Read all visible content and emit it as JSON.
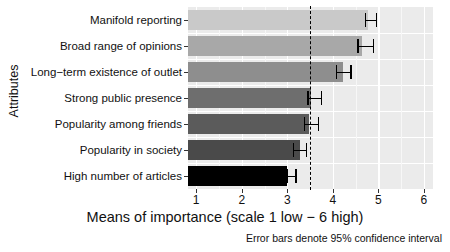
{
  "chart_data": {
    "type": "bar",
    "orientation": "horizontal",
    "title": "",
    "xlabel": "Means of importance (scale 1 low − 6 high)",
    "ylabel": "Attributes",
    "categories": [
      "Manifold reporting",
      "Broad range of opinions",
      "Long−term existence of outlet",
      "Strong public presence",
      "Popularity among friends",
      "Popularity in society",
      "High number of articles"
    ],
    "values": [
      4.78,
      4.64,
      4.23,
      3.51,
      3.47,
      3.29,
      3.0
    ],
    "ci_low": [
      4.7,
      4.53,
      4.06,
      3.44,
      3.36,
      3.12,
      2.98
    ],
    "ci_high": [
      4.98,
      4.91,
      4.42,
      3.77,
      3.7,
      3.44,
      3.21
    ],
    "bar_colors": [
      "#c9c9c9",
      "#a8a8a8",
      "#8e8e8e",
      "#6e6e6e",
      "#5b5b5b",
      "#4a4a4a",
      "#000000"
    ],
    "xlim": [
      0.82,
      6.2
    ],
    "xticks": [
      1,
      2,
      3,
      4,
      5,
      6
    ],
    "xtick_labels": [
      "1",
      "2",
      "3",
      "4",
      "5",
      "6"
    ],
    "reference_line": 3.5,
    "reference_line_style": "dashed",
    "grid": true,
    "panel_background": "#ebebeb",
    "gridline_color": "#ffffff",
    "legend": "none",
    "annotation": "Error bars denote 95% confidence interval"
  },
  "axis": {
    "y_title": "Attributes",
    "x_title": "Means of importance (scale 1 low − 6 high)"
  },
  "footnote": "Error bars denote 95% confidence interval"
}
